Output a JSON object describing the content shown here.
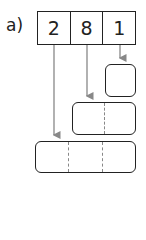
{
  "label": "a)",
  "digits": [
    "2",
    "8",
    "1"
  ],
  "boxes": [
    {
      "name": "ones-box",
      "parts": 1
    },
    {
      "name": "tens-box",
      "parts": 2
    },
    {
      "name": "hundreds-box",
      "parts": 3
    }
  ],
  "colors": {
    "line": "#222222",
    "arrow": "#888888",
    "dash": "#888888"
  }
}
